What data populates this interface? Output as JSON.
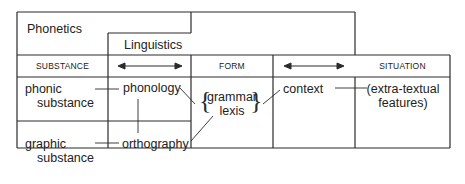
{
  "diagram": {
    "top_labels": {
      "phonetics": "Phonetics",
      "linguistics": "Linguistics"
    },
    "header_row": {
      "substance": "SUBSTANCE",
      "arrow_1": "double-headed-arrow",
      "form": "FORM",
      "arrow_2": "double-headed-arrow",
      "situation": "SITUATION"
    },
    "cells": {
      "phonic_substance": [
        "phonic",
        "substance"
      ],
      "graphic_substance": [
        "graphic",
        "substance"
      ],
      "phonology": "phonology",
      "orthography": "orthography",
      "grammar": "grammar",
      "lexis": "lexis",
      "context": "context",
      "extra_textual": [
        "(extra-textual",
        "features)"
      ]
    },
    "colors": {
      "line": "#2a2a2a",
      "text": "#222222",
      "background": "#ffffff"
    }
  }
}
